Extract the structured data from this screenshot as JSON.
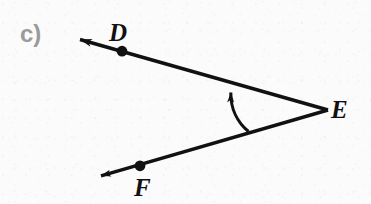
{
  "figure": {
    "part_label": "c)",
    "part_label_color": "#9a9a9a",
    "ink_color": "#111111",
    "background_color": "#fbfbfb",
    "type": "geometry-angle-diagram",
    "vertex_labels": {
      "d": "D",
      "e": "E",
      "f": "F"
    },
    "points": {
      "d": {
        "label": "D",
        "dot_x": 122,
        "dot_y": 51
      },
      "e": {
        "label": "E",
        "vertex_x": 328,
        "vertex_y": 110
      },
      "f": {
        "label": "F",
        "dot_x": 140,
        "dot_y": 166
      }
    },
    "rays": [
      {
        "name": "ray-ed",
        "from": "E",
        "through": "D",
        "start_x": 328,
        "start_y": 110,
        "end_x": 76,
        "end_y": 39,
        "arrowhead": "end"
      },
      {
        "name": "ray-ef",
        "from": "E",
        "through": "F",
        "start_x": 328,
        "start_y": 110,
        "end_x": 97,
        "end_y": 177,
        "arrowhead": "end"
      }
    ],
    "angle_arc": {
      "name": "angle-arc-arrow",
      "start_x": 248,
      "start_y": 131,
      "end_x": 231,
      "end_y": 85,
      "arrowhead": "end",
      "direction": "counterclockwise"
    }
  }
}
